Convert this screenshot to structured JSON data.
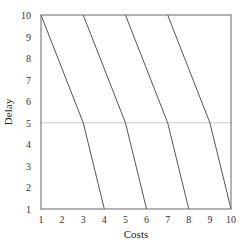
{
  "chart_data": {
    "type": "line",
    "title": "",
    "xlabel": "Costs",
    "ylabel": "Delay",
    "xlim": [
      1,
      10
    ],
    "ylim": [
      1,
      10
    ],
    "xticks": [
      1,
      2,
      3,
      4,
      5,
      6,
      7,
      8,
      9,
      10
    ],
    "yticks": [
      1,
      2,
      3,
      4,
      5,
      6,
      7,
      8,
      9,
      10
    ],
    "grid": false,
    "reference_line": {
      "axis": "y",
      "value": 5,
      "color": "#cccccc"
    },
    "series": [
      {
        "name": "line-1",
        "points": [
          [
            1,
            10
          ],
          [
            3,
            5
          ],
          [
            4,
            1
          ]
        ]
      },
      {
        "name": "line-2",
        "points": [
          [
            3,
            10
          ],
          [
            5,
            5
          ],
          [
            6,
            1
          ]
        ]
      },
      {
        "name": "line-3",
        "points": [
          [
            5,
            10
          ],
          [
            7,
            5
          ],
          [
            8,
            1
          ]
        ]
      },
      {
        "name": "line-4",
        "points": [
          [
            7,
            10
          ],
          [
            9,
            5
          ],
          [
            10,
            1
          ]
        ]
      }
    ],
    "colors": {
      "line": "#555555",
      "frame": "#666666",
      "reference": "#cccccc"
    }
  }
}
